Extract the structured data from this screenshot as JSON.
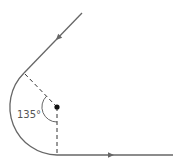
{
  "diagram": {
    "type": "circular-path-deflection",
    "angle_label": "135°",
    "colors": {
      "path": "#666666",
      "dashed": "#333333",
      "center_dot": "#111111",
      "label": "#555555"
    },
    "elements": {
      "incoming_line": {
        "direction": "down-left",
        "has_arrow": true
      },
      "circular_arc": {
        "side": "left",
        "description": "curved segment tangent to both straight lines"
      },
      "outgoing_line": {
        "direction": "right",
        "has_arrow": true
      },
      "radius_to_upper_tangent": {
        "style": "dashed"
      },
      "radius_to_lower_tangent": {
        "style": "dashed"
      },
      "center_point": {
        "style": "filled dot"
      },
      "angle_marker": {
        "value_deg": 135,
        "label": "135°"
      }
    }
  }
}
